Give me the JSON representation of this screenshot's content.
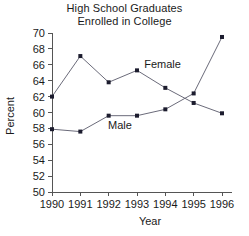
{
  "chart_data": {
    "type": "line",
    "title": "High School Graduates Enrolled in College",
    "title_lines": [
      "High School Graduates",
      "Enrolled in College"
    ],
    "xlabel": "Year",
    "ylabel": "Percent",
    "categories": [
      "1990",
      "1991",
      "1992",
      "1993",
      "1994",
      "1995",
      "1996"
    ],
    "x": [
      1990,
      1991,
      1992,
      1993,
      1994,
      1995,
      1996
    ],
    "xlim": [
      1990,
      1996
    ],
    "ylim": [
      50,
      70
    ],
    "ytick_labels": [
      "50",
      "52",
      "54",
      "56",
      "58",
      "60",
      "62",
      "64",
      "66",
      "68",
      "70"
    ],
    "yticks": [
      50,
      52,
      54,
      56,
      58,
      60,
      62,
      64,
      66,
      68,
      70
    ],
    "grid": false,
    "legend_position": "inline-annotations",
    "series": [
      {
        "name": "Female",
        "label": "Female",
        "values": [
          62.0,
          67.1,
          63.8,
          65.3,
          63.1,
          61.2,
          59.9
        ],
        "color": "#6b6b7a",
        "marker_color": "#1c1c2e"
      },
      {
        "name": "Male",
        "label": "Male",
        "values": [
          57.9,
          57.6,
          59.6,
          59.6,
          60.4,
          62.4,
          69.5
        ],
        "color": "#6b6b7a",
        "marker_color": "#1c1c2e"
      }
    ],
    "annotations": [
      {
        "text": "Female",
        "x": 1993.9,
        "y": 65.6
      },
      {
        "text": "Male",
        "x": 1992.4,
        "y": 57.9
      }
    ]
  }
}
